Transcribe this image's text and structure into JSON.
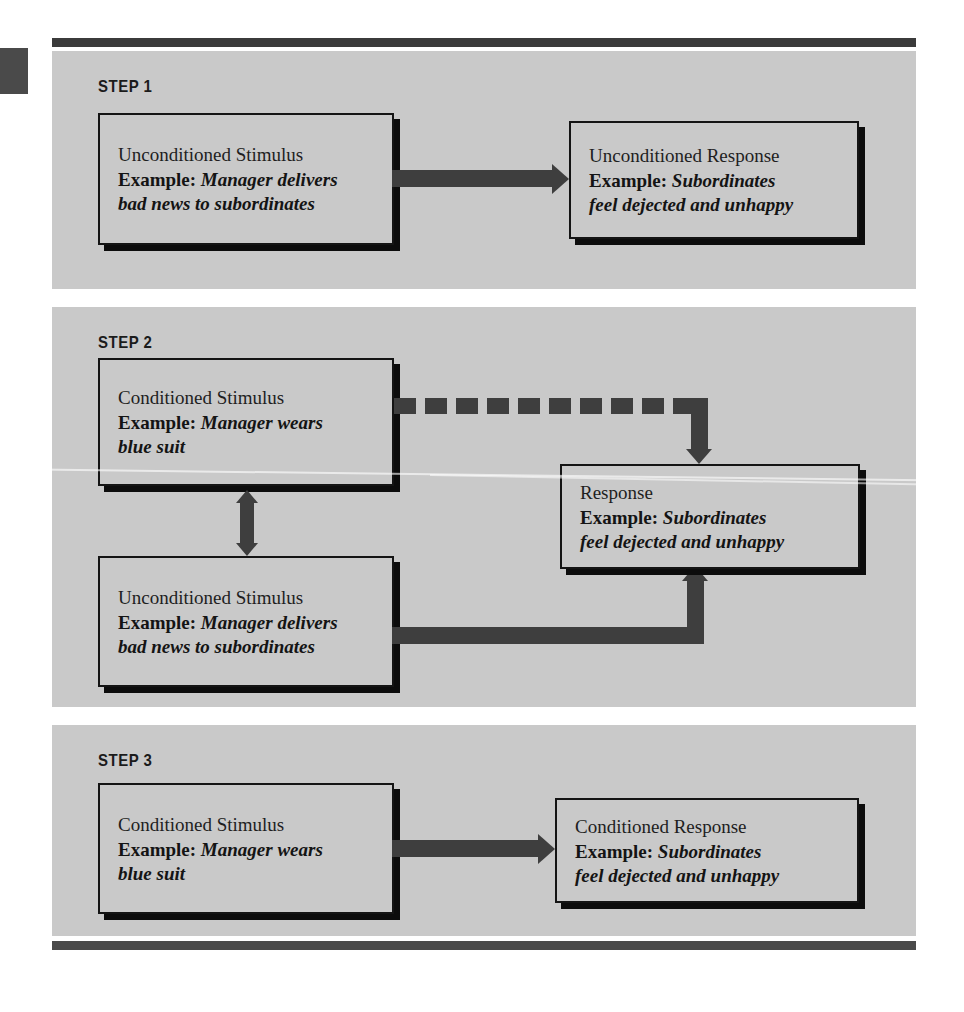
{
  "figure": {
    "panel_bg": "#c9c9c9",
    "frame_rule_color": "#3b3b3b",
    "arrow_color": "#3e3e3e",
    "box_border_color": "#141414"
  },
  "steps": [
    {
      "label": "STEP 1",
      "boxes": [
        {
          "id": "us-1",
          "title": "Unconditioned Stimulus",
          "example_label": "Example:",
          "example_value": "Manager delivers bad news to subordinates",
          "example_lines": [
            "Manager delivers",
            "bad news to subordinates"
          ]
        },
        {
          "id": "ur-1",
          "title": "Unconditioned Response",
          "example_label": "Example:",
          "example_value": "Subordinates feel dejected and unhappy",
          "example_lines": [
            "Subordinates",
            "feel dejected and  unhappy"
          ]
        }
      ],
      "connectors": [
        {
          "id": "arrow-us-to-ur",
          "style": "solid",
          "direction": "right"
        }
      ]
    },
    {
      "label": "STEP 2",
      "boxes": [
        {
          "id": "cs-2",
          "title": "Conditioned Stimulus",
          "example_label": "Example:",
          "example_value": "Manager wears blue suit",
          "example_lines": [
            "Manager wears",
            "blue suit"
          ]
        },
        {
          "id": "us-2",
          "title": "Unconditioned Stimulus",
          "example_label": "Example:",
          "example_value": "Manager delivers bad news to subordinates",
          "example_lines": [
            "Manager delivers",
            "bad news to subordinates"
          ]
        },
        {
          "id": "resp-2",
          "title": "Response",
          "example_label": "Example:",
          "example_value": "Subordinates feel dejected and unhappy",
          "example_lines": [
            "Subordinates",
            "feel dejected and unhappy"
          ]
        }
      ],
      "connectors": [
        {
          "id": "arrow-cs-to-response",
          "style": "dashed",
          "direction": "right-then-down"
        },
        {
          "id": "arrow-cs-to-us",
          "style": "solid",
          "direction": "down-double-point"
        },
        {
          "id": "arrow-us-to-response",
          "style": "solid",
          "direction": "right-then-up"
        }
      ]
    },
    {
      "label": "STEP 3",
      "boxes": [
        {
          "id": "cs-3",
          "title": "Conditioned Stimulus",
          "example_label": "Example:",
          "example_value": "Manager wears blue suit",
          "example_lines": [
            "Manager wears",
            "blue suit"
          ]
        },
        {
          "id": "cr-3",
          "title": "Conditioned Response",
          "example_label": "Example:",
          "example_value": "Subordinates feel dejected and unhappy",
          "example_lines": [
            "Subordinates",
            "feel dejected and  unhappy"
          ]
        }
      ],
      "connectors": [
        {
          "id": "arrow-cs-to-cr",
          "style": "solid",
          "direction": "right"
        }
      ]
    }
  ]
}
